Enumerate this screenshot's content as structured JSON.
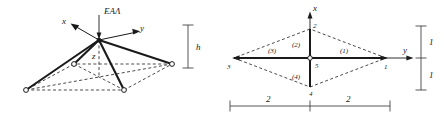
{
  "figure": {
    "background_color": "#ffffff",
    "line_color": "#1a1a1a",
    "dash_color": "#2b2b2b",
    "dim_color": "#3a3a3a"
  },
  "panel_3d": {
    "name": "space-truss-perspective",
    "load_label": "EAΛ",
    "axis_x_label": "x",
    "axis_y_label": "y",
    "axis_z_label": "z",
    "height_label": "h"
  },
  "panel_plan": {
    "name": "truss-plan-view",
    "axis_x_label": "x",
    "axis_y_label": "y",
    "nodes": [
      {
        "id": "1",
        "label": "1"
      },
      {
        "id": "2",
        "label": "2"
      },
      {
        "id": "3",
        "label": "3"
      },
      {
        "id": "4",
        "label": "4"
      },
      {
        "id": "5",
        "label": "5"
      }
    ],
    "members": [
      {
        "id": "m1",
        "label": "(1)"
      },
      {
        "id": "m2",
        "label": "(2)"
      },
      {
        "id": "m3",
        "label": "(3)"
      },
      {
        "id": "m4",
        "label": "(4)"
      }
    ],
    "dimensions": {
      "bottom_left": "2",
      "bottom_right": "2",
      "right_upper": "1",
      "right_lower": "1"
    }
  }
}
